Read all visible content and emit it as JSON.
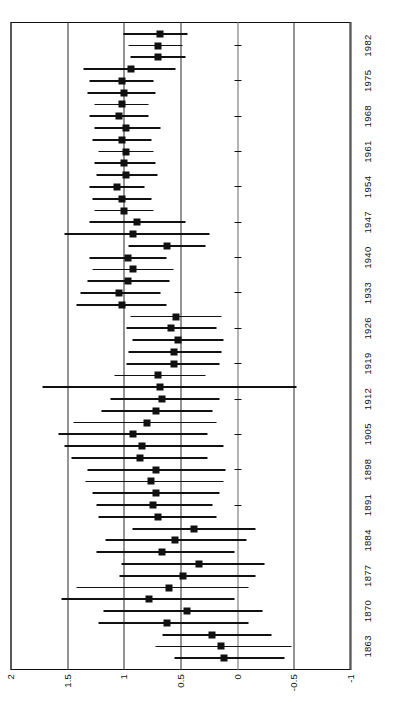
{
  "figure": {
    "type": "forest-plot",
    "orientation": "rotated-90"
  },
  "axis": {
    "value_ticks": [
      "2",
      "1.5",
      "1",
      "0.5",
      "0",
      "-0.5",
      "-1"
    ],
    "value_tick_numbers": [
      2,
      1.5,
      1,
      0.5,
      0,
      -0.5,
      -1
    ],
    "reference_line_value": 0,
    "year_ticks": [
      "1863",
      "1870",
      "1877",
      "1884",
      "1891",
      "1898",
      "1905",
      "1912",
      "1919",
      "1926",
      "1933",
      "1940",
      "1947",
      "1954",
      "1961",
      "1968",
      "1975",
      "1982"
    ]
  },
  "chart_data": {
    "type": "scatter",
    "title": "",
    "xlabel": "",
    "ylabel": "",
    "ylim": [
      -1,
      2
    ],
    "grid": true,
    "legend": "none",
    "categories": [
      "1863",
      "1870",
      "1877",
      "1884",
      "1891",
      "1898",
      "1905",
      "1912",
      "1919",
      "1926",
      "1933",
      "1940",
      "1947",
      "1954",
      "1961",
      "1968",
      "1975",
      "1982"
    ],
    "series": [
      {
        "name": "estimate",
        "points": [
          {
            "index": 0,
            "group": "1863",
            "value": 0.12,
            "low": -0.42,
            "high": 0.55
          },
          {
            "index": 1,
            "group": "1863",
            "value": 0.14,
            "low": -0.48,
            "high": 0.72
          },
          {
            "index": 2,
            "group": "1863",
            "value": 0.22,
            "low": -0.3,
            "high": 0.66
          },
          {
            "index": 3,
            "group": "1870",
            "value": 0.62,
            "low": -0.1,
            "high": 1.22
          },
          {
            "index": 4,
            "group": "1870",
            "value": 0.44,
            "low": -0.22,
            "high": 1.18
          },
          {
            "index": 5,
            "group": "1870",
            "value": 0.78,
            "low": 0.02,
            "high": 1.55
          },
          {
            "index": 6,
            "group": "1877",
            "value": 0.6,
            "low": -0.1,
            "high": 1.42
          },
          {
            "index": 7,
            "group": "1877",
            "value": 0.48,
            "low": -0.16,
            "high": 1.04
          },
          {
            "index": 8,
            "group": "1877",
            "value": 0.34,
            "low": -0.24,
            "high": 1.02
          },
          {
            "index": 9,
            "group": "1884",
            "value": 0.66,
            "low": 0.02,
            "high": 1.24
          },
          {
            "index": 10,
            "group": "1884",
            "value": 0.55,
            "low": -0.08,
            "high": 1.16
          },
          {
            "index": 11,
            "group": "1884",
            "value": 0.38,
            "low": -0.16,
            "high": 0.92
          },
          {
            "index": 12,
            "group": "1891",
            "value": 0.7,
            "low": 0.18,
            "high": 1.22
          },
          {
            "index": 13,
            "group": "1891",
            "value": 0.74,
            "low": 0.22,
            "high": 1.24
          },
          {
            "index": 14,
            "group": "1891",
            "value": 0.72,
            "low": 0.16,
            "high": 1.28
          },
          {
            "index": 15,
            "group": "1898",
            "value": 0.76,
            "low": 0.12,
            "high": 1.34
          },
          {
            "index": 16,
            "group": "1898",
            "value": 0.72,
            "low": 0.1,
            "high": 1.32
          },
          {
            "index": 17,
            "group": "1898",
            "value": 0.86,
            "low": 0.26,
            "high": 1.46
          },
          {
            "index": 18,
            "group": "1905",
            "value": 0.84,
            "low": 0.12,
            "high": 1.52
          },
          {
            "index": 19,
            "group": "1905",
            "value": 0.92,
            "low": 0.26,
            "high": 1.58
          },
          {
            "index": 20,
            "group": "1905",
            "value": 0.8,
            "low": 0.18,
            "high": 1.44
          },
          {
            "index": 21,
            "group": "1912",
            "value": 0.72,
            "low": 0.22,
            "high": 1.2
          },
          {
            "index": 22,
            "group": "1912",
            "value": 0.66,
            "low": 0.16,
            "high": 1.12
          },
          {
            "index": 23,
            "group": "1912",
            "value": 0.68,
            "low": -0.52,
            "high": 1.72
          },
          {
            "index": 24,
            "group": "1919",
            "value": 0.7,
            "low": 0.28,
            "high": 1.08
          },
          {
            "index": 25,
            "group": "1919",
            "value": 0.56,
            "low": 0.16,
            "high": 0.98
          },
          {
            "index": 26,
            "group": "1919",
            "value": 0.56,
            "low": 0.14,
            "high": 0.96
          },
          {
            "index": 27,
            "group": "1926",
            "value": 0.52,
            "low": 0.12,
            "high": 0.92
          },
          {
            "index": 28,
            "group": "1926",
            "value": 0.58,
            "low": 0.18,
            "high": 0.98
          },
          {
            "index": 29,
            "group": "1926",
            "value": 0.54,
            "low": 0.14,
            "high": 0.94
          },
          {
            "index": 30,
            "group": "1933",
            "value": 1.02,
            "low": 0.62,
            "high": 1.42
          },
          {
            "index": 31,
            "group": "1933",
            "value": 1.04,
            "low": 0.68,
            "high": 1.38
          },
          {
            "index": 32,
            "group": "1933",
            "value": 0.96,
            "low": 0.6,
            "high": 1.32
          },
          {
            "index": 33,
            "group": "1940",
            "value": 0.92,
            "low": 0.56,
            "high": 1.28
          },
          {
            "index": 34,
            "group": "1940",
            "value": 0.96,
            "low": 0.62,
            "high": 1.3
          },
          {
            "index": 35,
            "group": "1940",
            "value": 0.62,
            "low": 0.28,
            "high": 0.96
          },
          {
            "index": 36,
            "group": "1947",
            "value": 0.92,
            "low": 0.24,
            "high": 1.52
          },
          {
            "index": 37,
            "group": "1947",
            "value": 0.88,
            "low": 0.46,
            "high": 1.3
          },
          {
            "index": 38,
            "group": "1947",
            "value": 1.0,
            "low": 0.74,
            "high": 1.26
          },
          {
            "index": 39,
            "group": "1954",
            "value": 1.02,
            "low": 0.76,
            "high": 1.28
          },
          {
            "index": 40,
            "group": "1954",
            "value": 1.06,
            "low": 0.82,
            "high": 1.3
          },
          {
            "index": 41,
            "group": "1954",
            "value": 0.98,
            "low": 0.7,
            "high": 1.24
          },
          {
            "index": 42,
            "group": "1961",
            "value": 1.0,
            "low": 0.72,
            "high": 1.26
          },
          {
            "index": 43,
            "group": "1961",
            "value": 0.98,
            "low": 0.74,
            "high": 1.22
          },
          {
            "index": 44,
            "group": "1961",
            "value": 1.02,
            "low": 0.76,
            "high": 1.28
          },
          {
            "index": 45,
            "group": "1968",
            "value": 0.98,
            "low": 0.68,
            "high": 1.26
          },
          {
            "index": 46,
            "group": "1968",
            "value": 1.04,
            "low": 0.78,
            "high": 1.3
          },
          {
            "index": 47,
            "group": "1968",
            "value": 1.02,
            "low": 0.78,
            "high": 1.26
          },
          {
            "index": 48,
            "group": "1975",
            "value": 1.0,
            "low": 0.72,
            "high": 1.32
          },
          {
            "index": 49,
            "group": "1975",
            "value": 1.02,
            "low": 0.74,
            "high": 1.3
          },
          {
            "index": 50,
            "group": "1975",
            "value": 0.94,
            "low": 0.54,
            "high": 1.36
          },
          {
            "index": 51,
            "group": "1982",
            "value": 0.7,
            "low": 0.46,
            "high": 0.94
          },
          {
            "index": 52,
            "group": "1982",
            "value": 0.7,
            "low": 0.48,
            "high": 0.96
          },
          {
            "index": 53,
            "group": "1982",
            "value": 0.68,
            "low": 0.44,
            "high": 1.0
          }
        ]
      }
    ]
  },
  "style": {
    "marker_color": "#111111",
    "line_color": "#111111",
    "grid_color": "#2b2b2b",
    "background": "#ffffff"
  }
}
